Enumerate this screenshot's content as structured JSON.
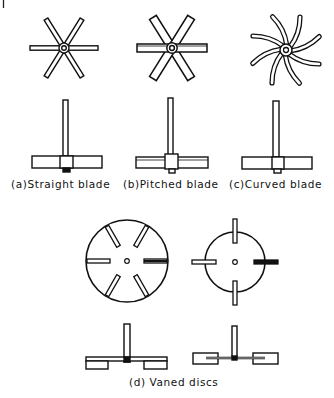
{
  "figure": {
    "type": "impeller-types-diagram",
    "ink_color": "#111111",
    "background": "#ffffff"
  },
  "impellers": [
    {
      "id": "a",
      "label": "(a)Straight blade",
      "top_view": {
        "cx": 64,
        "cy": 48,
        "blades": 6,
        "blade_shape": "straight-thin"
      },
      "side_view": {
        "cx": 65,
        "shaft_top": 100,
        "blade_y": 153
      }
    },
    {
      "id": "b",
      "label": "(b)Pitched blade",
      "top_view": {
        "cx": 172,
        "cy": 48,
        "blades": 6,
        "blade_shape": "straight-wide"
      },
      "side_view": {
        "cx": 171,
        "shaft_top": 98,
        "blade_y": 153
      }
    },
    {
      "id": "c",
      "label": "(c)Curved blade",
      "top_view": {
        "cx": 286,
        "cy": 50,
        "blades": 8,
        "blade_shape": "curved"
      },
      "side_view": {
        "cx": 277,
        "shaft_top": 101,
        "blade_y": 155
      }
    },
    {
      "id": "d",
      "label": "(d) Vaned discs",
      "discs": [
        {
          "cx": 127,
          "cy": 261,
          "r": 41,
          "vanes": 6
        },
        {
          "cx": 235,
          "cy": 262,
          "r": 30,
          "vanes": 4
        }
      ]
    }
  ],
  "labels": {
    "a": "(a)Straight blade",
    "b": "(b)Pitched blade",
    "c": "(c)Curved blade",
    "d": "(d) Vaned discs"
  }
}
